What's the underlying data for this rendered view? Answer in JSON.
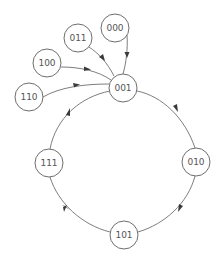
{
  "diagram": {
    "type": "state-transition-graph",
    "colors": {
      "stroke": "#6e6e6e",
      "text": "#555555",
      "arrow": "#3a3a3a",
      "background": "#ffffff"
    },
    "nodes": [
      {
        "id": "000",
        "label": "000",
        "cx": 115,
        "cy": 28,
        "r": 14
      },
      {
        "id": "011",
        "label": "011",
        "cx": 78,
        "cy": 38,
        "r": 14
      },
      {
        "id": "100",
        "label": "100",
        "cx": 47,
        "cy": 63,
        "r": 14
      },
      {
        "id": "110",
        "label": "110",
        "cx": 29,
        "cy": 97,
        "r": 14
      },
      {
        "id": "001",
        "label": "001",
        "cx": 123,
        "cy": 88,
        "r": 14
      },
      {
        "id": "010",
        "label": "010",
        "cx": 196,
        "cy": 162,
        "r": 14
      },
      {
        "id": "101",
        "label": "101",
        "cx": 124,
        "cy": 235,
        "r": 14
      },
      {
        "id": "111",
        "label": "111",
        "cx": 49,
        "cy": 163,
        "r": 14
      }
    ],
    "edges": [
      {
        "from": "000",
        "to": "001"
      },
      {
        "from": "011",
        "to": "001"
      },
      {
        "from": "100",
        "to": "001"
      },
      {
        "from": "110",
        "to": "001"
      },
      {
        "from": "001",
        "to": "010"
      },
      {
        "from": "010",
        "to": "101"
      },
      {
        "from": "101",
        "to": "111"
      },
      {
        "from": "111",
        "to": "001"
      }
    ]
  }
}
